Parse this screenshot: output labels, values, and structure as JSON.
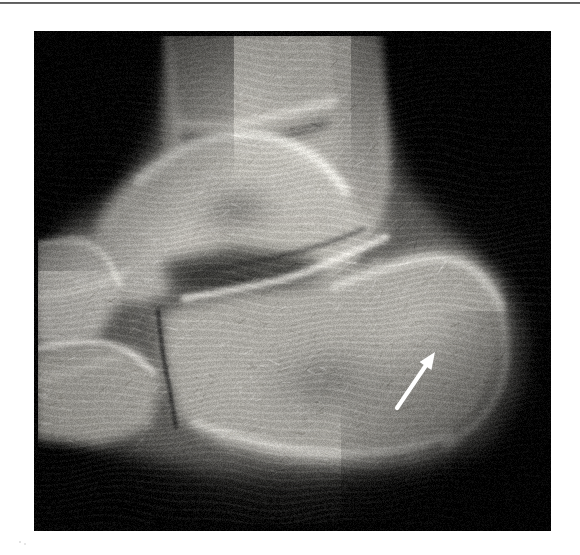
{
  "figure": {
    "kind": "radiograph",
    "modality": "X-ray",
    "view": "lateral foot and ankle",
    "background_color": "#ffffff",
    "film_background_color": "#000000",
    "rule": {
      "name": "top-horizontal-rule",
      "color": "#4a4a4a",
      "thickness_px": 2
    },
    "image_box": {
      "x": 34,
      "y": 31,
      "width": 517,
      "height": 500
    },
    "annotations": [
      {
        "type": "arrow",
        "color": "#ffffff",
        "tail": {
          "x": 363,
          "y": 377
        },
        "tip": {
          "x": 401,
          "y": 321
        },
        "points_to": "posterior calcaneus",
        "label": ""
      }
    ],
    "anatomy_labels": [
      "tibia",
      "fibula",
      "talus",
      "calcaneus",
      "navicular",
      "cuboid",
      "tibiotalar joint",
      "subtalar joint",
      "calcaneocuboid joint"
    ],
    "caption": ""
  },
  "render": {
    "bone_highlight_color": "#f2f0ec",
    "bone_midtone_color": "#a9a7a2",
    "soft_tissue_color": "#4d4c4a",
    "film_edge_color": "#0b0b0b",
    "moire_color": "#2a2a2a"
  }
}
